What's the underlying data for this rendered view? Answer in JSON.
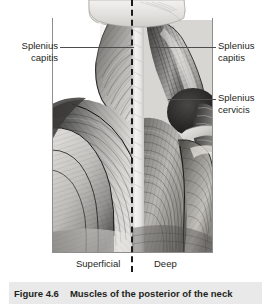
{
  "figure": {
    "caption_number": "Figure 4.6",
    "caption_text": "Muscles of the posterior of the neck",
    "illustration_name": "posterior-neck-muscles-illustration",
    "midline_style": "dashed",
    "colors": {
      "caption_bar_background": "#e9e9e9",
      "text": "#231f20",
      "leader_line": "#4d4d4d",
      "midline": "#1a1a1a",
      "frame_line": "#8e8e8e",
      "page_background": "#ffffff"
    }
  },
  "labels": {
    "splenius_capitis_left": "Splenius\ncapitis",
    "splenius_capitis_left_line1": "Splenius",
    "splenius_capitis_left_line2": "capitis",
    "splenius_capitis_right_line1": "Splenius",
    "splenius_capitis_right_line2": "capitis",
    "splenius_cervicis_line1": "Splenius",
    "splenius_cervicis_line2": "cervicis"
  },
  "views": {
    "left": "Superficial",
    "right": "Deep"
  }
}
